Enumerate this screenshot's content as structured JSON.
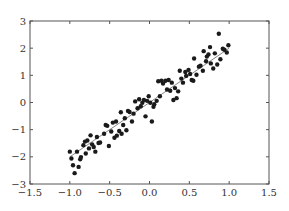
{
  "chart_data": {
    "type": "scatter",
    "title": "",
    "xlabel": "",
    "ylabel": "",
    "xlim": [
      -1.5,
      1.5
    ],
    "ylim": [
      -3,
      3
    ],
    "grid": false,
    "legend": null,
    "xticks": [
      "-1.5",
      "-1.0",
      "-0.5",
      "0.0",
      "0.5",
      "1.0",
      "1.5"
    ],
    "xtick_values": [
      -1.5,
      -1.0,
      -0.5,
      0.0,
      0.5,
      1.0,
      1.5
    ],
    "yticks": [
      "-3",
      "-2",
      "-1",
      "0",
      "1",
      "2",
      "3"
    ],
    "ytick_values": [
      -3,
      -2,
      -1,
      0,
      1,
      2,
      3
    ],
    "series": [
      {
        "name": "data",
        "kind": "scatter",
        "color": "#1a1a1a",
        "points": [
          [
            -1.0,
            -1.81
          ],
          [
            -0.98,
            -2.06
          ],
          [
            -0.96,
            -2.31
          ],
          [
            -0.94,
            -2.6
          ],
          [
            -0.91,
            -1.81
          ],
          [
            -0.89,
            -2.37
          ],
          [
            -0.87,
            -2.09
          ],
          [
            -0.86,
            -2.01
          ],
          [
            -0.83,
            -1.57
          ],
          [
            -0.81,
            -1.44
          ],
          [
            -0.8,
            -1.88
          ],
          [
            -0.78,
            -1.4
          ],
          [
            -0.76,
            -1.69
          ],
          [
            -0.74,
            -1.21
          ],
          [
            -0.72,
            -1.54
          ],
          [
            -0.7,
            -1.64
          ],
          [
            -0.68,
            -1.81
          ],
          [
            -0.66,
            -1.27
          ],
          [
            -0.64,
            -1.49
          ],
          [
            -0.62,
            -1.47
          ],
          [
            -0.57,
            -1.15
          ],
          [
            -0.55,
            -0.83
          ],
          [
            -0.53,
            -0.86
          ],
          [
            -0.51,
            -1.6
          ],
          [
            -0.48,
            -1.07
          ],
          [
            -0.46,
            -0.74
          ],
          [
            -0.44,
            -1.3
          ],
          [
            -0.42,
            -0.7
          ],
          [
            -0.41,
            -1.22
          ],
          [
            -0.38,
            -1.05
          ],
          [
            -0.36,
            -0.36
          ],
          [
            -0.35,
            -1.15
          ],
          [
            -0.33,
            -0.83
          ],
          [
            -0.31,
            -0.58
          ],
          [
            -0.29,
            -1.02
          ],
          [
            -0.27,
            -0.31
          ],
          [
            -0.25,
            -0.35
          ],
          [
            -0.22,
            -0.7
          ],
          [
            -0.2,
            -0.41
          ],
          [
            -0.18,
            0.04
          ],
          [
            -0.15,
            -0.21
          ],
          [
            -0.13,
            0.12
          ],
          [
            -0.11,
            -0.14
          ],
          [
            -0.09,
            -0.01
          ],
          [
            -0.07,
            0.09
          ],
          [
            -0.05,
            -0.51
          ],
          [
            -0.03,
            0.06
          ],
          [
            -0.01,
            0.23
          ],
          [
            0.01,
            -0.01
          ],
          [
            0.03,
            -0.7
          ],
          [
            0.05,
            -0.16
          ],
          [
            0.06,
            -0.06
          ],
          [
            0.09,
            0.06
          ],
          [
            0.11,
            0.78
          ],
          [
            0.13,
            0.23
          ],
          [
            0.15,
            0.8
          ],
          [
            0.17,
            0.7
          ],
          [
            0.2,
            0.8
          ],
          [
            0.22,
            0.48
          ],
          [
            0.24,
            0.83
          ],
          [
            0.26,
            0.43
          ],
          [
            0.28,
            0.73
          ],
          [
            0.3,
            0.09
          ],
          [
            0.32,
            0.53
          ],
          [
            0.34,
            0.16
          ],
          [
            0.36,
            0.41
          ],
          [
            0.38,
            1.17
          ],
          [
            0.4,
            0.88
          ],
          [
            0.42,
            0.73
          ],
          [
            0.45,
            1.12
          ],
          [
            0.46,
            0.98
          ],
          [
            0.49,
            1.2
          ],
          [
            0.51,
            1.05
          ],
          [
            0.53,
            0.83
          ],
          [
            0.55,
            0.8
          ],
          [
            0.56,
            1.62
          ],
          [
            0.59,
            1.02
          ],
          [
            0.62,
            1.32
          ],
          [
            0.64,
            1.35
          ],
          [
            0.67,
            1.17
          ],
          [
            0.68,
            1.89
          ],
          [
            0.71,
            1.52
          ],
          [
            0.72,
            1.69
          ],
          [
            0.74,
            1.77
          ],
          [
            0.76,
            2.04
          ],
          [
            0.77,
            1.44
          ],
          [
            0.8,
            1.25
          ],
          [
            0.82,
            1.81
          ],
          [
            0.85,
            1.4
          ],
          [
            0.87,
            2.53
          ],
          [
            0.89,
            1.59
          ],
          [
            0.92,
            1.98
          ],
          [
            0.94,
            1.94
          ],
          [
            0.97,
            1.84
          ],
          [
            0.99,
            2.11
          ]
        ]
      },
      {
        "name": "fit",
        "kind": "line",
        "color": "#888888",
        "x": [
          -1.0,
          1.0
        ],
        "y": [
          -2.0,
          2.0
        ]
      }
    ]
  },
  "layout": {
    "plot_left": 30,
    "plot_right": 269,
    "plot_top": 21,
    "plot_bottom": 184
  }
}
